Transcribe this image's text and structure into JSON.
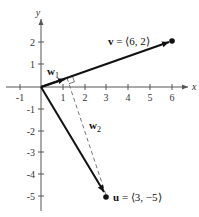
{
  "diagram": {
    "type": "vector-projection",
    "axes": {
      "x_label": "x",
      "y_label": "y",
      "x_ticks": [
        "-1",
        "1",
        "2",
        "3",
        "4",
        "5",
        "6"
      ],
      "y_ticks": [
        "2",
        "1",
        "-1",
        "-2",
        "-3",
        "-4",
        "-5"
      ],
      "xlim": [
        -1,
        6
      ],
      "ylim": [
        -5,
        2
      ]
    },
    "vectors": {
      "v": {
        "name": "v",
        "label": "v = ⟨6, 2⟩",
        "value_text": " = ⟨6, 2⟩",
        "x": 6,
        "y": 2
      },
      "u": {
        "name": "u",
        "label": "u = ⟨3, −5⟩",
        "value_text": " = ⟨3, −5⟩",
        "x": 3,
        "y": -5
      },
      "w1": {
        "name": "w",
        "subscript": "1",
        "x": 1.2,
        "y": 0.4
      },
      "w2": {
        "name": "w",
        "subscript": "2"
      }
    },
    "colors": {
      "axis": "#555555",
      "vector": "#111111",
      "dashed": "#777777"
    }
  }
}
